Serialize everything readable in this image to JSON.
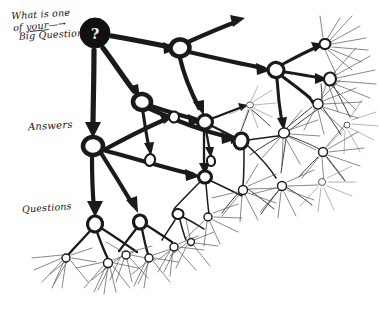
{
  "meta": {
    "background_color": "#ffffff",
    "ink_color": "#1a1a1a",
    "style": "hand-drawn sketch",
    "width": 379,
    "height": 311
  },
  "labels": {
    "big_question": {
      "line1": "What is one",
      "line2_prefix": "of ",
      "line2_underlined": "your",
      "line2_arrow": "—→",
      "line3": "Big Questions"
    },
    "answers": "Answers",
    "questions": "Questions"
  },
  "root_node": {
    "glyph": "?",
    "style": "filled-black-circle",
    "x": 95,
    "y": 33,
    "r": 15
  },
  "diagram": {
    "type": "fractal-branching-tree",
    "levels": [
      {
        "level": 0,
        "name": "Big Question",
        "count": 1,
        "stroke": "thick"
      },
      {
        "level": 1,
        "name": "Answers",
        "count": 3,
        "stroke": "thick"
      },
      {
        "level": 2,
        "name": "Questions",
        "count": 8,
        "stroke": "medium"
      },
      {
        "level": 3,
        "name": "Answers",
        "count": 16,
        "stroke": "thin"
      },
      {
        "level": 4,
        "name": "Questions",
        "count": 40,
        "stroke": "hairline"
      }
    ]
  },
  "nodes": [
    {
      "id": "root",
      "x": 95,
      "y": 33,
      "r": 15,
      "kind": "filled"
    },
    {
      "id": "a1",
      "x": 180,
      "y": 48,
      "r": 9.5,
      "kind": "ring"
    },
    {
      "id": "a2",
      "x": 142,
      "y": 102,
      "r": 9,
      "kind": "ring"
    },
    {
      "id": "a3",
      "x": 93,
      "y": 146,
      "r": 10,
      "kind": "ring"
    },
    {
      "id": "b1",
      "x": 276,
      "y": 70,
      "r": 8,
      "kind": "ring"
    },
    {
      "id": "b2",
      "x": 205,
      "y": 122,
      "r": 7.5,
      "kind": "ring"
    },
    {
      "id": "b3",
      "x": 241,
      "y": 141,
      "r": 7,
      "kind": "ring"
    },
    {
      "id": "b4",
      "x": 205,
      "y": 177,
      "r": 6.5,
      "kind": "ring"
    },
    {
      "id": "b5",
      "x": 95,
      "y": 224,
      "r": 7.5,
      "kind": "ring"
    },
    {
      "id": "b6",
      "x": 140,
      "y": 222,
      "r": 6.5,
      "kind": "ring"
    },
    {
      "id": "b7",
      "x": 178,
      "y": 214,
      "r": 5.5,
      "kind": "ring"
    },
    {
      "id": "c1",
      "x": 325,
      "y": 44,
      "r": 5.5,
      "kind": "ring"
    },
    {
      "id": "c2",
      "x": 330,
      "y": 79,
      "r": 6,
      "kind": "ring"
    },
    {
      "id": "c3",
      "x": 318,
      "y": 104,
      "r": 5,
      "kind": "ring"
    },
    {
      "id": "c4",
      "x": 284,
      "y": 133,
      "r": 5.5,
      "kind": "ring"
    },
    {
      "id": "c5",
      "x": 250,
      "y": 105,
      "r": 3.5,
      "kind": "ring"
    },
    {
      "id": "c6",
      "x": 323,
      "y": 152,
      "r": 4.5,
      "kind": "ring"
    }
  ],
  "colors": {
    "ink": "#1a1a1a",
    "ink_light": "#555555",
    "paper": "#ffffff"
  }
}
